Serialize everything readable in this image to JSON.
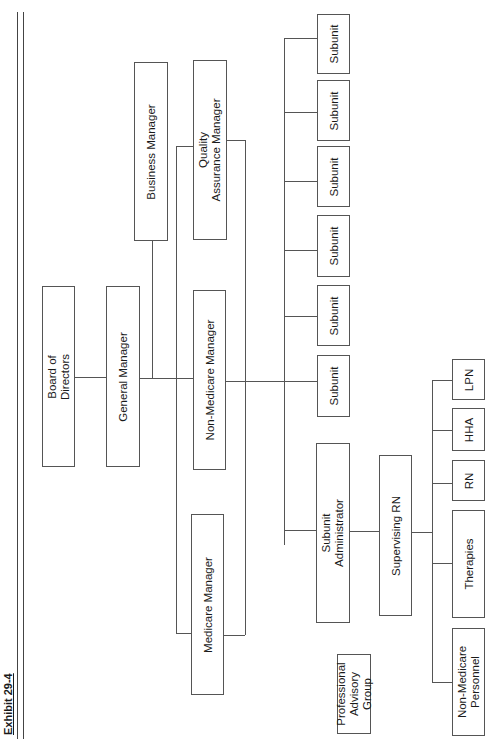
{
  "exhibit_label": "Exhibit 29-4",
  "org_chart": {
    "board": "Board of\nDirectors",
    "general_manager": "General Manager",
    "business_manager": "Business Manager",
    "quality_assurance_manager": "Quality\nAssurance Manager",
    "non_medicare_manager": "Non-Medicare Manager",
    "medicare_manager": "Medicare Manager",
    "subunits": [
      "Subunit",
      "Subunit",
      "Subunit",
      "Subunit",
      "Subunit",
      "Subunit"
    ],
    "subunit_administrator": "Subunit\nAdministrator",
    "supervising_rn": "Supervising RN",
    "staff": [
      "LPN",
      "HHA",
      "RN",
      "Therapies",
      "Non-Medicare\nPersonnel"
    ],
    "professional_advisory_group": "Professional\nAdvisory\nGroup"
  }
}
